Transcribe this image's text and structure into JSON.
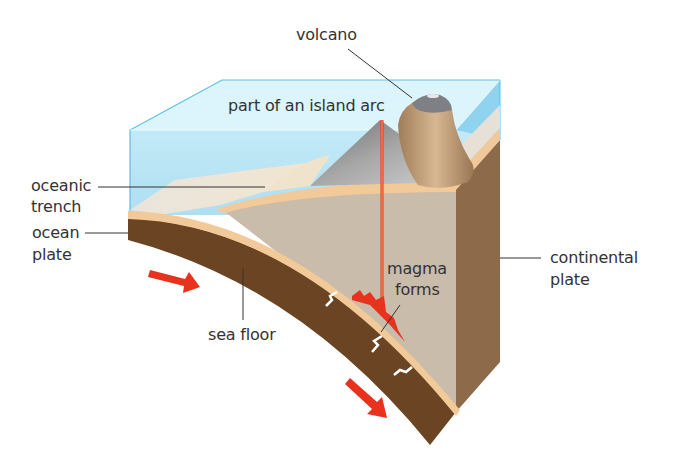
{
  "diagram": {
    "colors": {
      "water_top": "#d9f3fb",
      "water_front": "#a9dff2",
      "water_edge": "#5bbfe6",
      "ocean_plate": "#6b4423",
      "sea_floor_layer": "#f2c998",
      "continental_front": "#c9bcab",
      "continental_side": "#8d6b4a",
      "volcano_grey": "#8a8a8a",
      "cone_tan": "#c9a47e",
      "magma_red": "#e8321e",
      "arrow_red": "#e8321e"
    },
    "labels": {
      "volcano": "volcano",
      "island_arc": "part of an island arc",
      "oceanic_trench_line1": "oceanic",
      "oceanic_trench_line2": "trench",
      "ocean_plate_line1": "ocean",
      "ocean_plate_line2": "plate",
      "sea_floor": "sea floor",
      "magma_line1": "magma",
      "magma_line2": "forms",
      "continental_plate_line1": "continental",
      "continental_plate_line2": "plate"
    },
    "arrows": [
      {
        "name": "plate-motion-arrow-left",
        "direction": "right-down"
      },
      {
        "name": "plate-motion-arrow-bottom",
        "direction": "down-right"
      }
    ]
  }
}
